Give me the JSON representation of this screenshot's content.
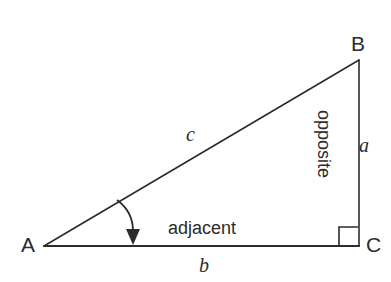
{
  "diagram": {
    "type": "right-triangle-trigonometry",
    "background_color": "#ffffff",
    "stroke_color": "#2b2b2b",
    "vertices": {
      "a": {
        "label": "A",
        "x": 44,
        "y": 246
      },
      "b": {
        "label": "B",
        "x": 359,
        "y": 60
      },
      "c": {
        "label": "C",
        "x": 359,
        "y": 246
      }
    },
    "sides": {
      "hypotenuse": {
        "label": "c",
        "from": "A",
        "to": "B"
      },
      "opposite": {
        "label": "a",
        "name": "opposite",
        "from": "B",
        "to": "C"
      },
      "adjacent": {
        "label": "b",
        "name": "adjacent",
        "from": "A",
        "to": "C"
      }
    },
    "markers": {
      "right_angle": {
        "at": "C",
        "size": 20
      },
      "angle_arrow": {
        "at": "A",
        "description": "curved-arrow-pointing-to-angle"
      }
    }
  }
}
